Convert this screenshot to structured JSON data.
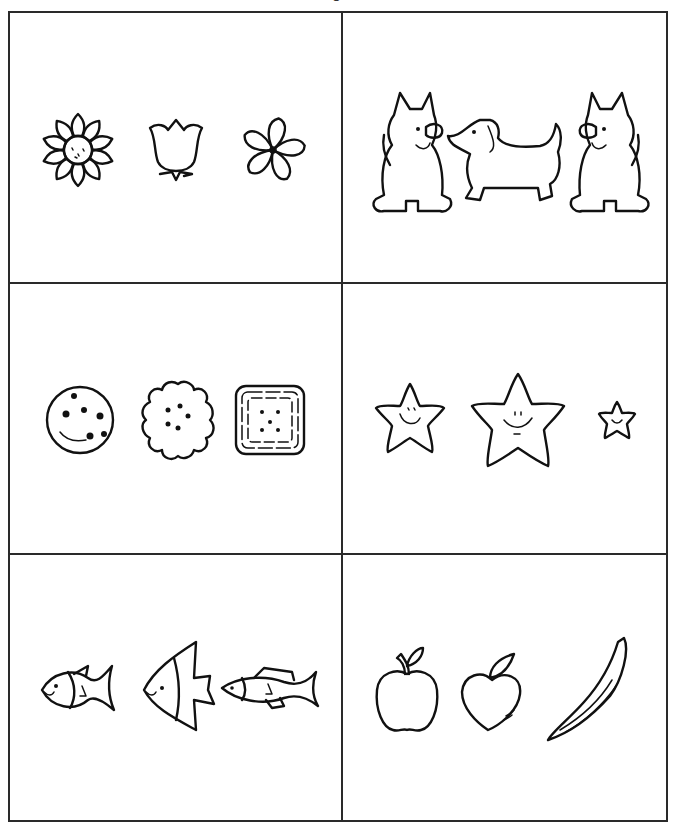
{
  "worksheet": {
    "header_fragment": "g",
    "layout": {
      "rows": 3,
      "columns": 2
    },
    "panels": [
      {
        "id": "flowers",
        "items": [
          "daisy-flower",
          "tulip-flower",
          "five-petal-flower"
        ]
      },
      {
        "id": "dogs",
        "items": [
          "sitting-terrier-dog",
          "dachshund-dog",
          "sitting-terrier-dog"
        ]
      },
      {
        "id": "cookies",
        "items": [
          "chocolate-chip-cookie",
          "scalloped-cookie",
          "square-cracker"
        ]
      },
      {
        "id": "stars",
        "items": [
          "medium-smiling-star",
          "large-smiling-star",
          "small-smiling-star"
        ]
      },
      {
        "id": "fish",
        "items": [
          "round-fish",
          "angelfish",
          "long-fish"
        ]
      },
      {
        "id": "fruit",
        "items": [
          "apple",
          "peach",
          "banana"
        ]
      }
    ],
    "colors": {
      "ink": "#111111",
      "grid": "#2a2a2a",
      "background": "#ffffff"
    }
  }
}
